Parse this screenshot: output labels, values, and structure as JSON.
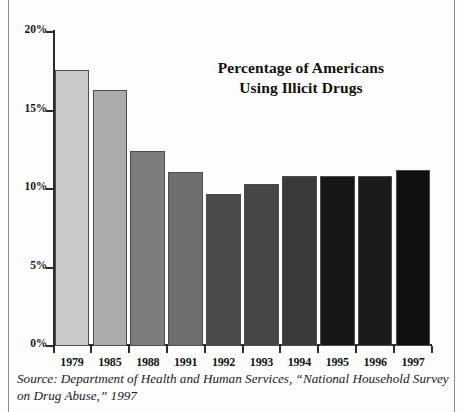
{
  "chart_data": {
    "type": "bar",
    "title": "Percentage of Americans Using Illicit Drugs",
    "title_line1": "Percentage of Americans",
    "title_line2": "Using Illicit Drugs",
    "xlabel": "",
    "ylabel": "",
    "categories": [
      "1979",
      "1985",
      "1988",
      "1991",
      "1992",
      "1993",
      "1994",
      "1995",
      "1996",
      "1997"
    ],
    "values": [
      17.6,
      16.3,
      12.4,
      11.1,
      9.7,
      10.3,
      10.8,
      10.8,
      10.8,
      11.2
    ],
    "bar_colors": [
      "#c9c9c9",
      "#ababab",
      "#7d7d7d",
      "#6e6e6e",
      "#4b4b4b",
      "#464646",
      "#3a3a3a",
      "#161616",
      "#1b1b1b",
      "#101010"
    ],
    "ylim": [
      0,
      20
    ],
    "ytick_values": [
      0,
      5,
      10,
      15,
      20
    ],
    "ytick_labels": [
      "0%",
      "5%",
      "10%",
      "15%",
      "20%"
    ],
    "grid": false,
    "legend": null,
    "units": "percent"
  },
  "source": {
    "text": "Source: Department of Health and Human Services, “National Household Survey on Drug Abuse,” 1997"
  },
  "colors": {
    "axis": "#2b2b2b",
    "text": "#141414",
    "rule": "#8c8c8c",
    "background": "#fdfdfd"
  }
}
